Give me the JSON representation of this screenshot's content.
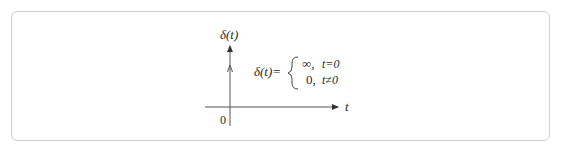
{
  "diagram": {
    "y_axis_label": "δ(t)",
    "x_axis_label": "t",
    "origin_label": "0",
    "definition": {
      "lhs": "δ(t)=",
      "cases": [
        {
          "value": "∞,",
          "condition": "t=0"
        },
        {
          "value": "0,",
          "condition": "t≠0"
        }
      ]
    },
    "colors": {
      "axis": "#555555",
      "border": "#cfcfcf",
      "text": "#2a2a2a"
    }
  }
}
